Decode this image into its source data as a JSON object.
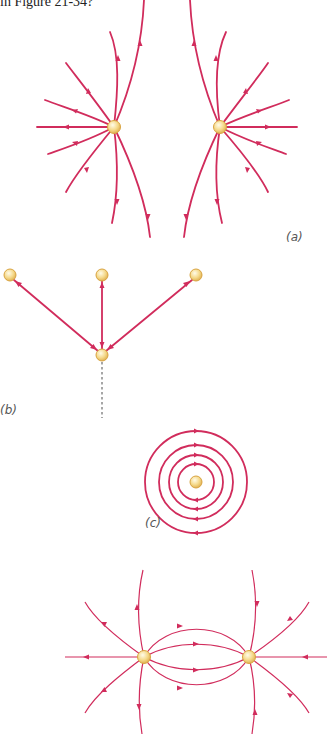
{
  "header": {
    "text": "in Figure 21-34?"
  },
  "panels": [
    {
      "id": "a",
      "label": "(a)",
      "description": "Two like charges (both sources) with field lines radiating outward"
    },
    {
      "id": "b",
      "label": "(b)",
      "description": "Three charges above one charge, with double-arrowed lines; dashed line downward"
    },
    {
      "id": "c",
      "label": "(c)",
      "description": "Single charge with four concentric circular field lines"
    },
    {
      "id": "d",
      "label": "",
      "description": "Two charges with field lines connecting them and radiating outward"
    }
  ],
  "colors": {
    "field_line": "#d12c5c",
    "charge_fill": "#f5d98a",
    "charge_stroke": "#d9a441",
    "label": "#555555"
  }
}
